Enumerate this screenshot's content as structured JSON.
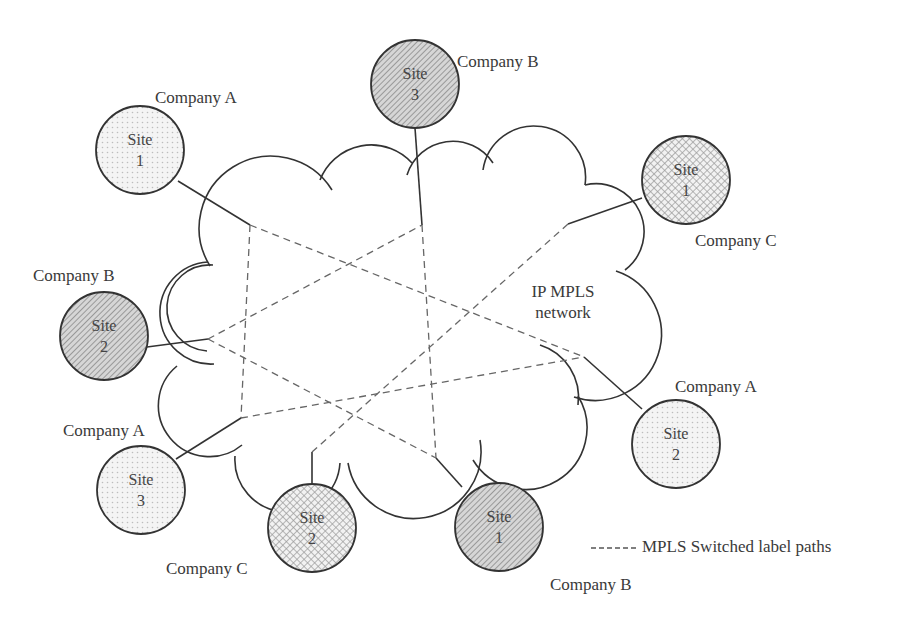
{
  "diagram": {
    "network": {
      "label_line1": "IP MPLS",
      "label_line2": "network"
    },
    "sites": [
      {
        "id": "a1",
        "company": "Company A",
        "site_line1": "Site",
        "site_line2": "1",
        "fill": "dots"
      },
      {
        "id": "b3",
        "company": "Company B",
        "site_line1": "Site",
        "site_line2": "3",
        "fill": "hatch"
      },
      {
        "id": "c1",
        "company": "Company C",
        "site_line1": "Site",
        "site_line2": "1",
        "fill": "crosshatch"
      },
      {
        "id": "b2",
        "company": "Company B",
        "site_line1": "Site",
        "site_line2": "2",
        "fill": "hatch"
      },
      {
        "id": "a2",
        "company": "Company A",
        "site_line1": "Site",
        "site_line2": "2",
        "fill": "dots"
      },
      {
        "id": "a3",
        "company": "Company A",
        "site_line1": "Site",
        "site_line2": "3",
        "fill": "dots"
      },
      {
        "id": "c2",
        "company": "Company C",
        "site_line1": "Site",
        "site_line2": "2",
        "fill": "crosshatch"
      },
      {
        "id": "b1",
        "company": "Company B",
        "site_line1": "Site",
        "site_line2": "1",
        "fill": "hatch"
      }
    ],
    "legend": {
      "dash_symbol": "------",
      "label": "MPLS Switched label paths"
    },
    "colors": {
      "stroke": "#333333",
      "dash": "#666666",
      "dots_fill": "#efefef",
      "hatch_fill": "#bdbdbd",
      "crosshatch_fill": "#d0d0d0"
    }
  }
}
